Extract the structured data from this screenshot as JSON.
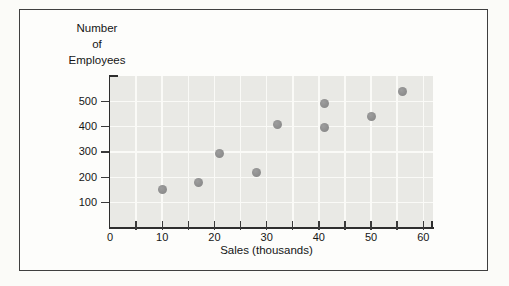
{
  "chart_data": {
    "type": "scatter",
    "title": "",
    "xlabel": "Sales (thousands)",
    "ylabel": "Number of Employees",
    "ylabel_lines": [
      "Number",
      "of",
      "Employees"
    ],
    "x_ticks": [
      0,
      10,
      20,
      30,
      40,
      50,
      60
    ],
    "x_minor_tick_step": 5,
    "y_ticks": [
      100,
      200,
      300,
      400,
      500
    ],
    "xlim": [
      0,
      62
    ],
    "ylim": [
      0,
      600
    ],
    "grid": {
      "style": "white gridlines on light gray panel",
      "x_step": 5,
      "y_step": 100
    },
    "points": [
      {
        "x": 10,
        "y": 150
      },
      {
        "x": 17,
        "y": 180
      },
      {
        "x": 21,
        "y": 295
      },
      {
        "x": 28,
        "y": 220
      },
      {
        "x": 32,
        "y": 410
      },
      {
        "x": 41,
        "y": 490
      },
      {
        "x": 41,
        "y": 395
      },
      {
        "x": 50,
        "y": 440
      },
      {
        "x": 56,
        "y": 540
      }
    ]
  },
  "colors": {
    "page_bg": "#fbfbf8",
    "panel_bg": "#fdfdfb",
    "panel_border": "#3f3f3f",
    "plot_bg": "#e9e9e5",
    "grid_line": "#fafaf7",
    "axis": "#2e2e2e",
    "tick_text": "#161616",
    "point_fill": "#8f8f8f"
  }
}
